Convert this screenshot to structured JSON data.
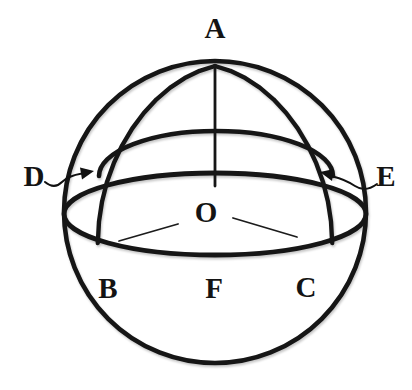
{
  "diagram": {
    "labels": {
      "apex": "A",
      "bottom_left": "B",
      "bottom_right": "C",
      "left_pointer": "D",
      "right_pointer": "E",
      "bottom_front": "F",
      "center": "O"
    },
    "colors": {
      "line": "#161616",
      "background": "#ffffff"
    }
  }
}
